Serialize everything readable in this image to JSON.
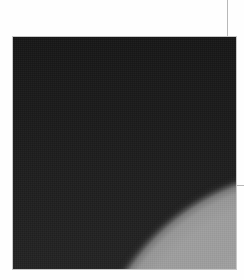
{
  "image": {
    "subject": "planetary limb against dark sky",
    "alt": "Grayscale photograph showing the curved bright edge of a planet against a dark background",
    "colors": {
      "sky": "#1b1b1b",
      "planet": "#9e9e9e",
      "limb_shadow": "#4a4a4a",
      "frame_border": "#c8c8c8",
      "page_background": "#fefefe"
    }
  }
}
